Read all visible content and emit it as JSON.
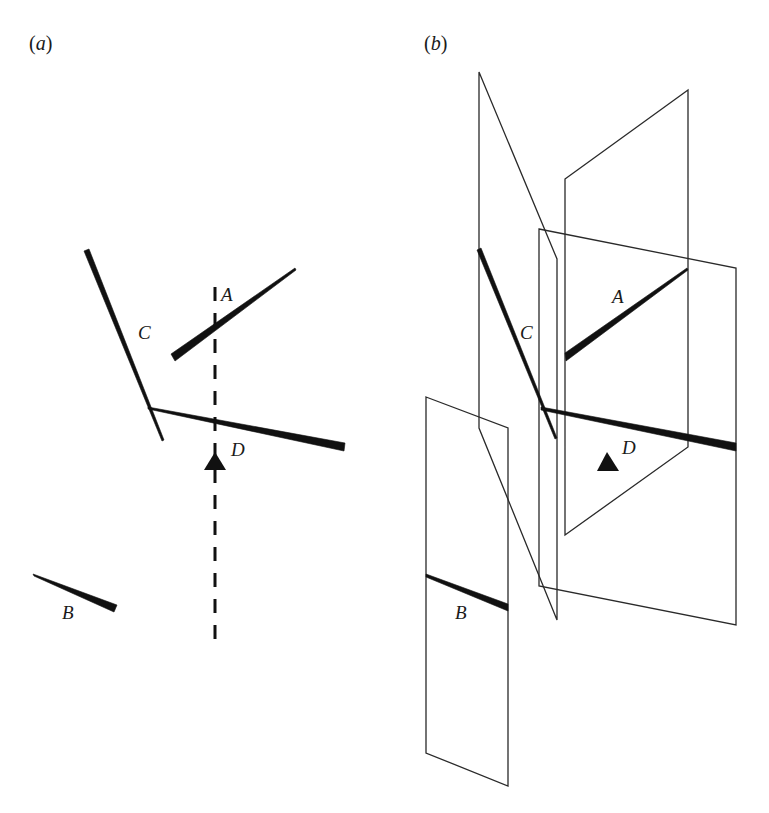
{
  "figure": {
    "panels": [
      {
        "id": "a",
        "label_open": "(",
        "label_letter": "a",
        "label_close": ")",
        "description": "Map view of fault traces A, B, C, D with a dashed vertical line passing through A and D and a triangle marker near D"
      },
      {
        "id": "b",
        "label_open": "(",
        "label_letter": "b",
        "label_close": ")",
        "description": "Perspective view of fault planes containing fault traces A, B, C, D with triangle marker"
      }
    ],
    "fault_labels": {
      "A": "A",
      "B": "B",
      "C": "C",
      "D": "D"
    },
    "colors": {
      "ink": "#111111",
      "plane_outline": "#2a2a2a",
      "background": "#ffffff"
    }
  }
}
